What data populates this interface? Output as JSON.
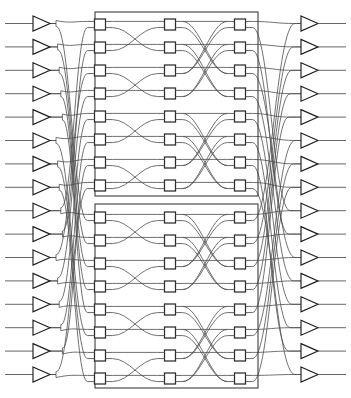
{
  "figure": {
    "type": "switching-fabric-diagram",
    "background_color": "#ffffff",
    "line_color": "#4c4c4c",
    "box_stroke_color": "#2b2b2b",
    "box_fill_color": "#ffffff",
    "frame_color": "#3d3d3d",
    "buffer_stroke_color": "#1e1e1e"
  },
  "canvas": {
    "width": 351,
    "height": 398
  },
  "geometry": {
    "input_buffer_x": 33,
    "input_buffer_width": 17,
    "input_buffer_height": 15,
    "input_line_start_x": 5,
    "output_buffer_x": 301,
    "output_buffer_width": 17,
    "output_buffer_height": 15,
    "output_line_end_x": 346,
    "switch_box_size": 11,
    "column_x": [
      100,
      170,
      240
    ],
    "plane_frame_left": 95,
    "plane_frame_right": 258,
    "row_pitch": 23,
    "top_plane_first_row_y": 19,
    "bottom_plane_first_row_y": 212,
    "top_plane_frame": {
      "y": 12,
      "height": 184
    },
    "bottom_plane_frame": {
      "y": 204,
      "height": 184
    }
  },
  "counts": {
    "input_ports": 16,
    "output_ports": 16,
    "planes": 2,
    "rows_per_plane": 8,
    "stages_per_plane": 3,
    "switch_elements_per_plane": 24,
    "switch_elements_total": 48,
    "switch_radix": "2x2"
  },
  "ports": {
    "input_labels": [
      "I0",
      "I1",
      "I2",
      "I3",
      "I4",
      "I5",
      "I6",
      "I7",
      "I8",
      "I9",
      "I10",
      "I11",
      "I12",
      "I13",
      "I14",
      "I15"
    ],
    "output_labels": [
      "O0",
      "O1",
      "O2",
      "O3",
      "O4",
      "O5",
      "O6",
      "O7",
      "O8",
      "O9",
      "O10",
      "O11",
      "O12",
      "O13",
      "O14",
      "O15"
    ],
    "input_icon": "buffer-triangle-right-icon",
    "output_icon": "buffer-triangle-right-icon"
  },
  "planes": [
    {
      "name": "top-plane",
      "id": "plane-0",
      "rows": 8,
      "stages": [
        {
          "name": "stage-1",
          "column": 0,
          "x": 100,
          "shuffle_stride": 1
        },
        {
          "name": "stage-2",
          "column": 1,
          "x": 170,
          "shuffle_stride": 2
        },
        {
          "name": "stage-3",
          "column": 2,
          "x": 240,
          "shuffle_stride": 4
        }
      ]
    },
    {
      "name": "bottom-plane",
      "id": "plane-1",
      "rows": 8,
      "stages": [
        {
          "name": "stage-1",
          "column": 0,
          "x": 100,
          "shuffle_stride": 1
        },
        {
          "name": "stage-2",
          "column": 1,
          "x": 170,
          "shuffle_stride": 2
        },
        {
          "name": "stage-3",
          "column": 2,
          "x": 240,
          "shuffle_stride": 4
        }
      ]
    }
  ],
  "wiring": {
    "input_permutation_note": "perfect-shuffle from 16 inputs to 32 plane terminals",
    "output_permutation_note": "inverse-shuffle from 32 plane terminals to 16 outputs",
    "interstage_pattern": "butterfly / omega shuffle",
    "input_to_plane_map": [
      0,
      2,
      4,
      6,
      8,
      10,
      12,
      14,
      16,
      18,
      20,
      22,
      24,
      26,
      28,
      30
    ],
    "plane_to_output_map": [
      0,
      2,
      4,
      6,
      8,
      10,
      12,
      14,
      16,
      18,
      20,
      22,
      24,
      26,
      28,
      30
    ]
  }
}
